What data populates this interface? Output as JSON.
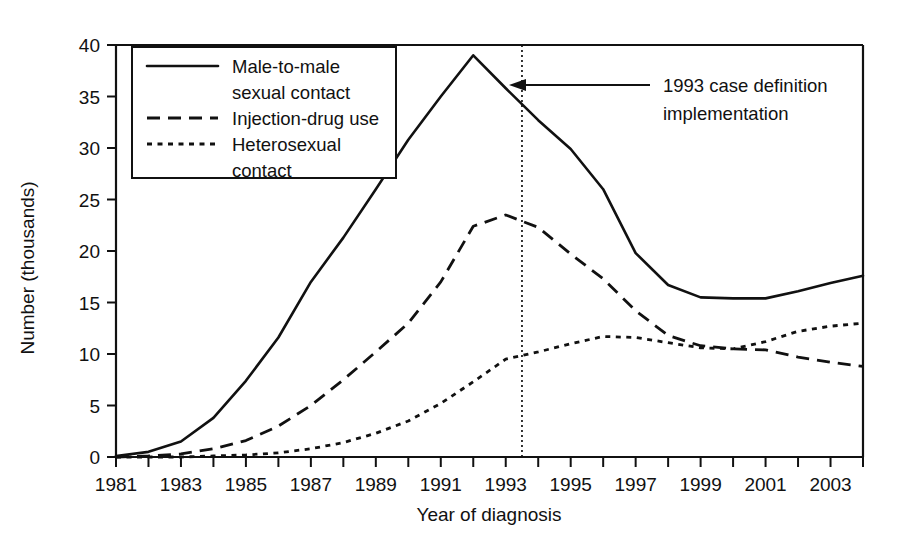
{
  "chart_data": {
    "type": "line",
    "title": "",
    "xlabel": "Year of diagnosis",
    "ylabel": "Number (thousands)",
    "xlim": [
      1981,
      2004
    ],
    "ylim": [
      0,
      40
    ],
    "yticks": [
      0,
      5,
      10,
      15,
      20,
      25,
      30,
      35,
      40
    ],
    "ytick_labels": [
      "0",
      "5",
      "10",
      "15",
      "20",
      "25",
      "30",
      "35",
      "40"
    ],
    "xticks": [
      1981,
      1982,
      1983,
      1984,
      1985,
      1986,
      1987,
      1988,
      1989,
      1990,
      1991,
      1992,
      1993,
      1994,
      1995,
      1996,
      1997,
      1998,
      1999,
      2000,
      2001,
      2002,
      2003,
      2004
    ],
    "xtick_labels_shown": [
      "1981",
      "1983",
      "1985",
      "1987",
      "1989",
      "1991",
      "1993",
      "1995",
      "1997",
      "1999",
      "2001",
      "2003"
    ],
    "grid": false,
    "legend_position": "upper-left-inside",
    "x": [
      1981,
      1982,
      1983,
      1984,
      1985,
      1986,
      1987,
      1988,
      1989,
      1990,
      1991,
      1992,
      1993,
      1994,
      1995,
      1996,
      1997,
      1998,
      1999,
      2000,
      2001,
      2002,
      2003,
      2004
    ],
    "series": [
      {
        "name": "Male-to-male sexual contact",
        "style": "solid",
        "values": [
          0.1,
          0.5,
          1.5,
          3.8,
          7.4,
          11.6,
          17.0,
          21.3,
          26.0,
          30.8,
          35.0,
          39.0,
          35.8,
          32.7,
          29.9,
          26.0,
          19.8,
          16.7,
          15.5,
          15.4,
          15.4,
          16.1,
          16.9,
          17.6
        ]
      },
      {
        "name": "Injection-drug use",
        "style": "dashed",
        "values": [
          0.0,
          0.1,
          0.3,
          0.8,
          1.6,
          3.0,
          5.0,
          7.5,
          10.2,
          13.0,
          17.0,
          22.4,
          23.5,
          22.3,
          19.7,
          17.3,
          14.2,
          11.8,
          10.8,
          10.5,
          10.4,
          9.7,
          9.2,
          8.8
        ]
      },
      {
        "name": "Heterosexual contact",
        "style": "dotted",
        "values": [
          0.0,
          0.0,
          0.0,
          0.1,
          0.2,
          0.4,
          0.8,
          1.4,
          2.3,
          3.5,
          5.2,
          7.3,
          9.5,
          10.2,
          11.0,
          11.7,
          11.6,
          11.1,
          10.6,
          10.5,
          11.2,
          12.2,
          12.7,
          13.0
        ]
      }
    ],
    "legend": [
      {
        "label_line1": "Male-to-male",
        "label_line2": "sexual contact",
        "style": "solid"
      },
      {
        "label_line1": "Injection-drug use",
        "label_line2": "",
        "style": "dashed"
      },
      {
        "label_line1": "Heterosexual",
        "label_line2": "contact",
        "style": "dotted"
      }
    ],
    "annotations": [
      {
        "name": "case-definition-annotation",
        "line1": "1993 case definition",
        "line2": "implementation",
        "marker_x": 1993.5,
        "marker_type": "vertical-dotted-line-with-arrow"
      }
    ]
  }
}
